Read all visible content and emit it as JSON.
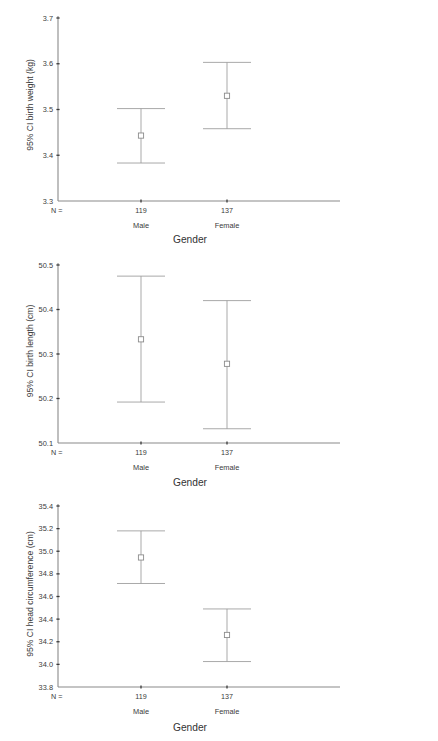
{
  "figure": {
    "charts": [
      {
        "id": "birth-weight",
        "chart_data": {
          "type": "scatter",
          "title": "",
          "subtitle": "",
          "xlabel": "Gender",
          "ylabel": "95% CI birth weight (kg)",
          "categories": [
            "Male",
            "Female"
          ],
          "group_counts": [
            "119",
            "137"
          ],
          "n_legend": "N =",
          "ylim": [
            3.3,
            3.7
          ],
          "yticks": [
            3.3,
            3.4,
            3.5,
            3.6,
            3.7
          ],
          "ytick_labels": [
            "3.3",
            "3.4",
            "3.5",
            "3.6",
            "3.7"
          ],
          "grid": false,
          "legend": "none",
          "series": [
            {
              "name": "Mean with 95% CI",
              "points": [
                {
                  "category": "Male",
                  "mean": 3.443,
                  "ci_low": 3.383,
                  "ci_high": 3.502
                },
                {
                  "category": "Female",
                  "mean": 3.53,
                  "ci_low": 3.458,
                  "ci_high": 3.603
                }
              ]
            }
          ]
        }
      },
      {
        "id": "birth-length",
        "chart_data": {
          "type": "scatter",
          "title": "",
          "subtitle": "",
          "xlabel": "Gender",
          "ylabel": "95% CI birth length (cm)",
          "categories": [
            "Male",
            "Female"
          ],
          "group_counts": [
            "119",
            "137"
          ],
          "n_legend": "N =",
          "ylim": [
            50.1,
            50.5
          ],
          "yticks": [
            50.1,
            50.2,
            50.3,
            50.4,
            50.5
          ],
          "ytick_labels": [
            "50.1",
            "50.2",
            "50.3",
            "50.4",
            "50.5"
          ],
          "grid": false,
          "legend": "none",
          "series": [
            {
              "name": "Mean with 95% CI",
              "points": [
                {
                  "category": "Male",
                  "mean": 50.333,
                  "ci_low": 50.192,
                  "ci_high": 50.475
                },
                {
                  "category": "Female",
                  "mean": 50.278,
                  "ci_low": 50.132,
                  "ci_high": 50.42
                }
              ]
            }
          ]
        }
      },
      {
        "id": "head-circumference",
        "chart_data": {
          "type": "scatter",
          "title": "",
          "subtitle": "",
          "xlabel": "Gender",
          "ylabel": "95% CI head circumference (cm)",
          "categories": [
            "Male",
            "Female"
          ],
          "group_counts": [
            "119",
            "137"
          ],
          "n_legend": "N =",
          "ylim": [
            33.8,
            35.4
          ],
          "yticks": [
            33.8,
            34.0,
            34.2,
            34.4,
            34.6,
            34.8,
            35.0,
            35.2,
            35.4
          ],
          "ytick_labels": [
            "33.8",
            "34.0",
            "34.2",
            "34.4",
            "34.6",
            "34.8",
            "35.0",
            "35.2",
            "35.4"
          ],
          "grid": false,
          "legend": "none",
          "series": [
            {
              "name": "Mean with 95% CI",
              "points": [
                {
                  "category": "Male",
                  "mean": 34.945,
                  "ci_low": 34.715,
                  "ci_high": 35.18
                },
                {
                  "category": "Female",
                  "mean": 34.26,
                  "ci_low": 34.025,
                  "ci_high": 34.49
                }
              ]
            }
          ]
        }
      }
    ]
  },
  "colors": {
    "axis": "#8a8a8a",
    "error_bar": "#9a9a9a",
    "marker_stroke": "#8c8c8c",
    "marker_fill": "#ffffff",
    "text": "#3a3a3a",
    "background": "#ffffff"
  }
}
